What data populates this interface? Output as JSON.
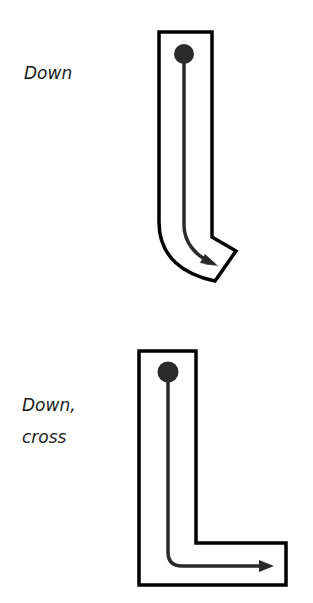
{
  "figures": [
    {
      "label_lines": [
        "Down"
      ],
      "shape": "J-shaped stroke guide",
      "description": "Start dot at top, arrow goes down then curves right"
    },
    {
      "label_lines": [
        "Down,",
        "cross"
      ],
      "shape": "L-shaped stroke guide",
      "description": "Start dot at top, arrow goes down then turns right across"
    }
  ],
  "colors": {
    "outline": "#000000",
    "stroke_path": "#2a2a2a",
    "background": "#ffffff"
  }
}
